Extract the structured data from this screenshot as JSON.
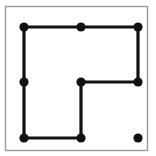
{
  "canvas": {
    "width": 156,
    "height": 156,
    "background_color": "#ffffff",
    "title": "Dot Path Puzzle"
  },
  "frame": {
    "name": "panel-border",
    "x": 5.5,
    "y": 6.5,
    "width": 142,
    "height": 144,
    "stroke_color": "#9a9a9a",
    "stroke_width": 1.4,
    "fill": "none"
  },
  "graph": {
    "dot_color": "#111111",
    "dot_radius": 4.6,
    "edge_color": "#111111",
    "edge_width": 3.2,
    "nodes": [
      {
        "id": "n-top-left",
        "label": "top-left",
        "x": 24,
        "y": 27,
        "connected": true
      },
      {
        "id": "n-top-center",
        "label": "top-center",
        "x": 81,
        "y": 27,
        "connected": true
      },
      {
        "id": "n-top-right",
        "label": "top-right",
        "x": 138,
        "y": 27,
        "connected": true
      },
      {
        "id": "n-middle-left",
        "label": "middle-left",
        "x": 24,
        "y": 82,
        "connected": true
      },
      {
        "id": "n-middle-center",
        "label": "middle-center",
        "x": 81,
        "y": 82,
        "connected": true
      },
      {
        "id": "n-middle-right",
        "label": "middle-right",
        "x": 138,
        "y": 82,
        "connected": true
      },
      {
        "id": "n-bottom-left",
        "label": "bottom-left",
        "x": 24,
        "y": 138,
        "connected": true
      },
      {
        "id": "n-bottom-center",
        "label": "bottom-center",
        "x": 81,
        "y": 138,
        "connected": true
      },
      {
        "id": "n-bottom-right",
        "label": "bottom-right",
        "x": 138,
        "y": 138,
        "connected": false
      }
    ],
    "edges": [
      {
        "id": "e-top-left-to-top-center",
        "from": "n-top-left",
        "to": "n-top-center",
        "x1": 24,
        "y1": 27,
        "x2": 81,
        "y2": 27
      },
      {
        "id": "e-top-center-to-top-right",
        "from": "n-top-center",
        "to": "n-top-right",
        "x1": 81,
        "y1": 27,
        "x2": 138,
        "y2": 27
      },
      {
        "id": "e-top-right-to-middle-right",
        "from": "n-top-right",
        "to": "n-middle-right",
        "x1": 138,
        "y1": 27,
        "x2": 138,
        "y2": 82
      },
      {
        "id": "e-middle-right-to-middle-center",
        "from": "n-middle-right",
        "to": "n-middle-center",
        "x1": 138,
        "y1": 82,
        "x2": 81,
        "y2": 82
      },
      {
        "id": "e-middle-center-to-bottom-center",
        "from": "n-middle-center",
        "to": "n-bottom-center",
        "x1": 81,
        "y1": 82,
        "x2": 81,
        "y2": 138
      },
      {
        "id": "e-bottom-center-to-bottom-left",
        "from": "n-bottom-center",
        "to": "n-bottom-left",
        "x1": 81,
        "y1": 138,
        "x2": 24,
        "y2": 138
      },
      {
        "id": "e-bottom-left-to-middle-left",
        "from": "n-bottom-left",
        "to": "n-middle-left",
        "x1": 24,
        "y1": 138,
        "x2": 24,
        "y2": 82
      },
      {
        "id": "e-middle-left-to-top-left",
        "from": "n-middle-left",
        "to": "n-top-left",
        "x1": 24,
        "y1": 82,
        "x2": 24,
        "y2": 27
      }
    ]
  }
}
